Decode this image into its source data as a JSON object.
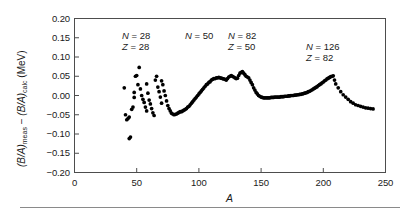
{
  "figure": {
    "background": "#ffffff",
    "frame_color": "#4d4d4d",
    "point_color": "#000000"
  },
  "axis": {
    "y_label_prefix": "(B/A)",
    "y_label_sub1": "meas",
    "y_label_minus": " − ",
    "y_label_prefix2": "(B/A)",
    "y_label_sub2": "calc",
    "y_label_units": "  (MeV)",
    "x_label": "A",
    "y_ticks": [
      "0.20",
      "0.15",
      "0.10",
      "0.05",
      "0.00",
      "−0.05",
      "−0.10",
      "−0.15",
      "−0.20"
    ],
    "x_ticks": [
      "0",
      "50",
      "100",
      "150",
      "200",
      "250"
    ]
  },
  "annotations": [
    {
      "name": "shell-closure-n28",
      "line1": "N = 28",
      "line2": "Z = 28",
      "x": 122,
      "y": 30
    },
    {
      "name": "shell-closure-n50",
      "line1": "N = 50",
      "line2": "",
      "x": 185,
      "y": 30
    },
    {
      "name": "shell-closure-n82",
      "line1": "N = 82",
      "line2": "Z = 50",
      "x": 228,
      "y": 30
    },
    {
      "name": "shell-closure-n126",
      "line1": "N = 126",
      "line2": "Z = 82",
      "x": 306,
      "y": 41
    }
  ],
  "chart_data": {
    "type": "scatter",
    "title": "",
    "xlabel": "A",
    "ylabel": "(B/A)meas − (B/A)calc (MeV)",
    "xlim": [
      0,
      250
    ],
    "ylim": [
      -0.2,
      0.2
    ],
    "xticks": [
      0,
      50,
      100,
      150,
      200,
      250
    ],
    "yticks": [
      -0.2,
      -0.15,
      -0.1,
      -0.05,
      0.0,
      0.05,
      0.1,
      0.15,
      0.2
    ],
    "grid": false,
    "legend": null,
    "marker": "filled-circle",
    "series": [
      {
        "name": "(B/A)meas - (B/A)calc",
        "points": [
          [
            40,
            0.02
          ],
          [
            41,
            -0.05
          ],
          [
            42,
            -0.063
          ],
          [
            43,
            -0.06
          ],
          [
            44,
            -0.056
          ],
          [
            44,
            -0.112
          ],
          [
            45,
            -0.108
          ],
          [
            46,
            -0.036
          ],
          [
            47,
            -0.03
          ],
          [
            48,
            0.008
          ],
          [
            48,
            -0.005
          ],
          [
            49,
            0.05
          ],
          [
            50,
            0.052
          ],
          [
            51,
            0.028
          ],
          [
            52,
            0.073
          ],
          [
            53,
            0.017
          ],
          [
            54,
            0.0
          ],
          [
            55,
            -0.01
          ],
          [
            56,
            -0.018
          ],
          [
            57,
            -0.03
          ],
          [
            58,
            -0.04
          ],
          [
            58,
            0.03
          ],
          [
            59,
            0.006
          ],
          [
            60,
            -0.012
          ],
          [
            61,
            -0.022
          ],
          [
            62,
            -0.034
          ],
          [
            63,
            -0.045
          ],
          [
            64,
            -0.052
          ],
          [
            65,
            0.04
          ],
          [
            66,
            0.05
          ],
          [
            67,
            0.022
          ],
          [
            68,
            0.01
          ],
          [
            69,
            -0.004
          ],
          [
            70,
            -0.02
          ],
          [
            70,
            0.038
          ],
          [
            71,
            0.028
          ],
          [
            72,
            0.012
          ],
          [
            73,
            0.0
          ],
          [
            74,
            -0.014
          ],
          [
            75,
            -0.026
          ],
          [
            76,
            -0.034
          ],
          [
            77,
            -0.04
          ],
          [
            78,
            -0.046
          ],
          [
            79,
            -0.048
          ],
          [
            80,
            -0.05
          ],
          [
            81,
            -0.049
          ],
          [
            82,
            -0.048
          ],
          [
            83,
            -0.046
          ],
          [
            84,
            -0.044
          ],
          [
            85,
            -0.042
          ],
          [
            86,
            -0.042
          ],
          [
            87,
            -0.04
          ],
          [
            88,
            -0.038
          ],
          [
            89,
            -0.036
          ],
          [
            90,
            -0.034
          ],
          [
            91,
            -0.03
          ],
          [
            92,
            -0.028
          ],
          [
            93,
            -0.024
          ],
          [
            94,
            -0.02
          ],
          [
            95,
            -0.016
          ],
          [
            96,
            -0.012
          ],
          [
            97,
            -0.008
          ],
          [
            98,
            -0.004
          ],
          [
            99,
            0.0
          ],
          [
            100,
            0.004
          ],
          [
            101,
            0.008
          ],
          [
            102,
            0.012
          ],
          [
            103,
            0.016
          ],
          [
            104,
            0.02
          ],
          [
            105,
            0.024
          ],
          [
            106,
            0.028
          ],
          [
            107,
            0.03
          ],
          [
            108,
            0.034
          ],
          [
            109,
            0.036
          ],
          [
            110,
            0.04
          ],
          [
            111,
            0.042
          ],
          [
            112,
            0.044
          ],
          [
            113,
            0.044
          ],
          [
            114,
            0.046
          ],
          [
            115,
            0.046
          ],
          [
            116,
            0.047
          ],
          [
            117,
            0.046
          ],
          [
            118,
            0.045
          ],
          [
            119,
            0.044
          ],
          [
            120,
            0.043
          ],
          [
            121,
            0.042
          ],
          [
            122,
            0.04
          ],
          [
            123,
            0.044
          ],
          [
            124,
            0.048
          ],
          [
            125,
            0.05
          ],
          [
            126,
            0.052
          ],
          [
            127,
            0.05
          ],
          [
            128,
            0.048
          ],
          [
            129,
            0.046
          ],
          [
            130,
            0.044
          ],
          [
            131,
            0.045
          ],
          [
            132,
            0.052
          ],
          [
            133,
            0.058
          ],
          [
            134,
            0.06
          ],
          [
            135,
            0.062
          ],
          [
            136,
            0.058
          ],
          [
            137,
            0.054
          ],
          [
            138,
            0.05
          ],
          [
            139,
            0.048
          ],
          [
            140,
            0.046
          ],
          [
            141,
            0.04
          ],
          [
            142,
            0.034
          ],
          [
            143,
            0.028
          ],
          [
            144,
            0.02
          ],
          [
            145,
            0.014
          ],
          [
            146,
            0.008
          ],
          [
            147,
            0.004
          ],
          [
            148,
            0.0
          ],
          [
            149,
            -0.002
          ],
          [
            150,
            -0.004
          ],
          [
            151,
            -0.005
          ],
          [
            152,
            -0.006
          ],
          [
            153,
            -0.006
          ],
          [
            154,
            -0.006
          ],
          [
            155,
            -0.006
          ],
          [
            156,
            -0.006
          ],
          [
            157,
            -0.006
          ],
          [
            158,
            -0.005
          ],
          [
            159,
            -0.005
          ],
          [
            160,
            -0.005
          ],
          [
            161,
            -0.004
          ],
          [
            162,
            -0.004
          ],
          [
            163,
            -0.004
          ],
          [
            164,
            -0.004
          ],
          [
            165,
            -0.004
          ],
          [
            166,
            -0.003
          ],
          [
            167,
            -0.003
          ],
          [
            168,
            -0.003
          ],
          [
            169,
            -0.002
          ],
          [
            170,
            -0.002
          ],
          [
            171,
            -0.002
          ],
          [
            172,
            -0.001
          ],
          [
            173,
            -0.001
          ],
          [
            174,
            0.0
          ],
          [
            175,
            0.0
          ],
          [
            176,
            0.0
          ],
          [
            177,
            0.001
          ],
          [
            178,
            0.001
          ],
          [
            179,
            0.002
          ],
          [
            180,
            0.002
          ],
          [
            181,
            0.003
          ],
          [
            182,
            0.003
          ],
          [
            183,
            0.004
          ],
          [
            184,
            0.005
          ],
          [
            185,
            0.006
          ],
          [
            186,
            0.007
          ],
          [
            187,
            0.008
          ],
          [
            188,
            0.01
          ],
          [
            189,
            0.011
          ],
          [
            190,
            0.013
          ],
          [
            191,
            0.015
          ],
          [
            192,
            0.017
          ],
          [
            193,
            0.019
          ],
          [
            194,
            0.021
          ],
          [
            195,
            0.023
          ],
          [
            196,
            0.026
          ],
          [
            197,
            0.028
          ],
          [
            198,
            0.03
          ],
          [
            199,
            0.033
          ],
          [
            200,
            0.035
          ],
          [
            201,
            0.038
          ],
          [
            202,
            0.04
          ],
          [
            203,
            0.043
          ],
          [
            204,
            0.045
          ],
          [
            205,
            0.047
          ],
          [
            206,
            0.049
          ],
          [
            207,
            0.05
          ],
          [
            208,
            0.051
          ],
          [
            209,
            0.04
          ],
          [
            210,
            0.03
          ],
          [
            212,
            0.02
          ],
          [
            214,
            0.01
          ],
          [
            216,
            0.002
          ],
          [
            218,
            -0.004
          ],
          [
            220,
            -0.01
          ],
          [
            222,
            -0.016
          ],
          [
            224,
            -0.02
          ],
          [
            226,
            -0.024
          ],
          [
            228,
            -0.026
          ],
          [
            230,
            -0.028
          ],
          [
            232,
            -0.03
          ],
          [
            234,
            -0.032
          ],
          [
            236,
            -0.033
          ],
          [
            238,
            -0.034
          ],
          [
            240,
            -0.035
          ]
        ]
      }
    ]
  }
}
